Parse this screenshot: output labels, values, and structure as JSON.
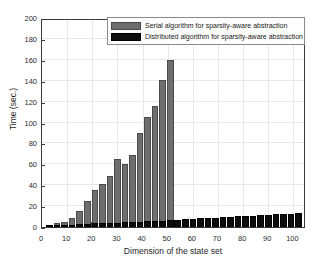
{
  "chart_data": {
    "type": "bar",
    "title": "",
    "xlabel": "Dimension of the state set",
    "ylabel": "Time (sec.)",
    "xlim": [
      0,
      105
    ],
    "ylim": [
      0,
      200
    ],
    "xticks": [
      0,
      10,
      20,
      30,
      40,
      50,
      60,
      70,
      80,
      90,
      100
    ],
    "yticks": [
      0,
      20,
      40,
      60,
      80,
      100,
      120,
      140,
      160,
      180,
      200
    ],
    "grid": true,
    "legend_position": "top-right",
    "colors": {
      "serial": "#6e6e6e",
      "distributed": "#0d0d0d",
      "axis": "#3a3a3a",
      "grid": "#e8e8e8",
      "background": "#ffffff"
    },
    "x": [
      3,
      6,
      9,
      12,
      15,
      18,
      21,
      24,
      27,
      30,
      33,
      36,
      39,
      42,
      45,
      48,
      51,
      54,
      57,
      60,
      63,
      66,
      69,
      72,
      75,
      78,
      81,
      84,
      87,
      90,
      93,
      96,
      99,
      102
    ],
    "series": [
      {
        "name": "Serial algorithm for sparsity-aware abstraction",
        "color": "#6e6e6e",
        "values": [
          2,
          3.5,
          5,
          8.5,
          15.5,
          25,
          35.5,
          41,
          48.5,
          65.5,
          60.5,
          68.5,
          90,
          105,
          116,
          141,
          160,
          null,
          null,
          null,
          null,
          null,
          null,
          null,
          null,
          null,
          null,
          null,
          null,
          null,
          null,
          null,
          null,
          null
        ]
      },
      {
        "name": "Distributed algorithm for sparsity-aware abstraction",
        "color": "#0d0d0d",
        "values": [
          1.2,
          1.6,
          2.0,
          2.4,
          2.8,
          3.1,
          3.4,
          3.7,
          4.0,
          4.3,
          4.6,
          4.9,
          5.2,
          5.5,
          5.8,
          6.1,
          6.4,
          7.0,
          7.5,
          8.0,
          8.3,
          8.6,
          9.0,
          9.4,
          9.8,
          10.2,
          10.6,
          11.0,
          11.3,
          11.6,
          12.0,
          12.4,
          12.8,
          13.2
        ]
      }
    ]
  },
  "legend": {
    "entries": [
      {
        "label": "Serial algorithm for sparsity-aware abstraction"
      },
      {
        "label": "Distributed algorithm for sparsity-aware abstraction"
      }
    ]
  }
}
